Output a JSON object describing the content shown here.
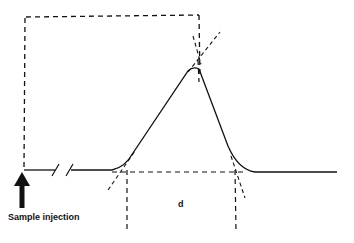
{
  "diagram": {
    "type": "chromatogram-peak-tangent-construction",
    "labels": {
      "injection": "Sample injection",
      "width": "d"
    },
    "colors": {
      "line": "#111111",
      "background": "#ffffff"
    },
    "elements": [
      "baseline with axis break",
      "sample injection arrow",
      "gaussian-like peak",
      "tangent lines at inflection points",
      "dashed baseline extension",
      "dashed retention box",
      "vertical dashed markers at tangent intercepts"
    ]
  }
}
